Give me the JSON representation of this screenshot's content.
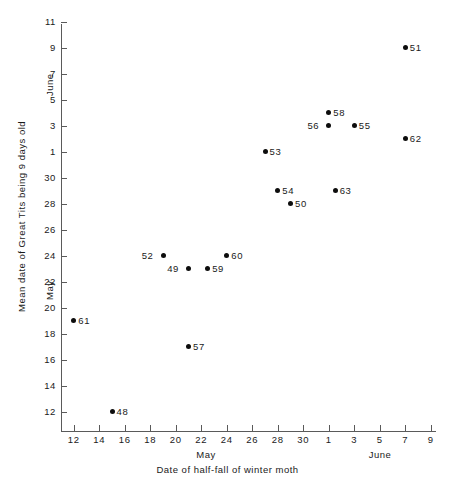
{
  "chart_data": {
    "type": "scatter",
    "title": "",
    "xlabel": "Date of half-fall of winter moth",
    "ylabel": "Mean date of Great Tits being 9 days old",
    "xlabel_month_left": "May",
    "xlabel_month_right": "June",
    "ylabel_month_lower": "May",
    "ylabel_month_upper": "June",
    "grid": false,
    "legend": "none",
    "x_axis": {
      "tick_labels": [
        "12",
        "14",
        "16",
        "18",
        "20",
        "22",
        "24",
        "26",
        "28",
        "30",
        "1",
        "3",
        "5",
        "7",
        "9"
      ],
      "tick_values": [
        12,
        14,
        16,
        18,
        20,
        22,
        24,
        26,
        28,
        30,
        32,
        34,
        36,
        38,
        40
      ],
      "xlim": [
        11,
        41
      ],
      "month_break_after": "30",
      "note": "Values 1-9 are June dates following May 30"
    },
    "y_axis": {
      "tick_labels": [
        "12",
        "14",
        "16",
        "18",
        "20",
        "22",
        "24",
        "26",
        "28",
        "30",
        "1",
        "3",
        "5",
        "7",
        "9",
        "11"
      ],
      "tick_values": [
        12,
        14,
        16,
        18,
        20,
        22,
        24,
        26,
        28,
        30,
        32,
        34,
        36,
        38,
        40,
        42
      ],
      "ylim": [
        10.5,
        42
      ],
      "month_break_after": "30",
      "note": "Values 1-11 are June dates following May 30"
    },
    "points": [
      {
        "label": "48",
        "x": 15,
        "y": 12,
        "x_date": "May 15",
        "y_date": "May 12",
        "label_side": "right"
      },
      {
        "label": "61",
        "x": 12,
        "y": 19,
        "x_date": "May 12",
        "y_date": "May 19",
        "label_side": "right"
      },
      {
        "label": "57",
        "x": 21,
        "y": 17,
        "x_date": "May 21",
        "y_date": "May 17",
        "label_side": "right"
      },
      {
        "label": "49",
        "x": 21,
        "y": 23,
        "x_date": "May 21",
        "y_date": "May 23",
        "label_side": "left"
      },
      {
        "label": "59",
        "x": 22.5,
        "y": 23,
        "x_date": "May 22",
        "y_date": "May 23",
        "label_side": "right"
      },
      {
        "label": "52",
        "x": 19,
        "y": 24,
        "x_date": "May 19",
        "y_date": "May 24",
        "label_side": "left"
      },
      {
        "label": "60",
        "x": 24,
        "y": 24,
        "x_date": "May 24",
        "y_date": "May 24",
        "label_side": "right"
      },
      {
        "label": "50",
        "x": 29,
        "y": 28,
        "x_date": "May 29",
        "y_date": "May 28",
        "label_side": "right"
      },
      {
        "label": "54",
        "x": 28,
        "y": 29,
        "x_date": "May 28",
        "y_date": "May 29",
        "label_side": "right"
      },
      {
        "label": "63",
        "x": 32.5,
        "y": 29,
        "x_date": "June 1",
        "y_date": "May 29",
        "label_side": "right"
      },
      {
        "label": "53",
        "x": 27,
        "y": 32,
        "x_date": "May 27",
        "y_date": "June 1",
        "label_side": "right"
      },
      {
        "label": "62",
        "x": 38,
        "y": 33,
        "x_date": "June 7",
        "y_date": "June 2",
        "label_side": "right"
      },
      {
        "label": "55",
        "x": 34,
        "y": 34,
        "x_date": "June 3",
        "y_date": "June 3",
        "label_side": "right"
      },
      {
        "label": "56",
        "x": 32,
        "y": 34,
        "x_date": "May 30",
        "y_date": "June 3",
        "label_side": "left"
      },
      {
        "label": "58",
        "x": 32,
        "y": 35,
        "x_date": "May 30",
        "y_date": "June 4",
        "label_side": "right"
      },
      {
        "label": "51",
        "x": 38,
        "y": 40,
        "x_date": "June 7",
        "y_date": "June 9",
        "label_side": "right"
      }
    ]
  }
}
